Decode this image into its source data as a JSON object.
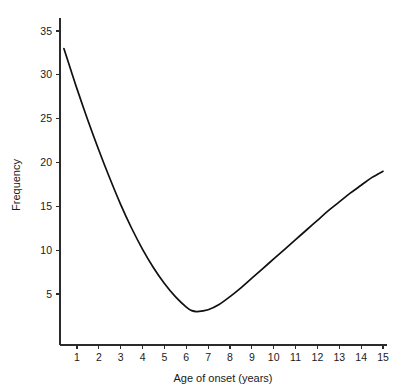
{
  "chart_data": {
    "type": "line",
    "title": "",
    "subtitle": "",
    "xlabel": "Age of onset (years)",
    "ylabel": "Frequency",
    "xlim": [
      0,
      15.6
    ],
    "ylim": [
      0,
      36.5
    ],
    "xticks": [
      1,
      2,
      3,
      4,
      5,
      6,
      7,
      8,
      9,
      10,
      11,
      12,
      13,
      14,
      15
    ],
    "xtick_labels": [
      "1",
      "2",
      "3",
      "4",
      "5",
      "6",
      "7",
      "8",
      "9",
      "10",
      "11",
      "12",
      "13",
      "14",
      "15"
    ],
    "yticks": [
      5,
      10,
      15,
      20,
      25,
      30,
      35
    ],
    "ytick_labels": [
      "5",
      "10",
      "15",
      "20",
      "25",
      "30",
      "35"
    ],
    "grid": false,
    "legend": null,
    "annotations": [],
    "line_color": "#101010",
    "background_color": "#ffffff",
    "series": [
      {
        "name": "Frequency of onset",
        "x": [
          0.4,
          0.75,
          1,
          1.5,
          2,
          2.5,
          3,
          3.5,
          4,
          4.5,
          5,
          5.5,
          6,
          6.25,
          6.5,
          7,
          7.5,
          8,
          8.5,
          9,
          9.5,
          10,
          10.5,
          11,
          11.5,
          12,
          12.5,
          13,
          13.5,
          14,
          14.5,
          15
        ],
        "y": [
          33.0,
          30.3,
          28.4,
          24.8,
          21.4,
          18.2,
          15.2,
          12.5,
          10.1,
          8.0,
          6.2,
          4.7,
          3.5,
          3.1,
          3.0,
          3.2,
          3.8,
          4.7,
          5.7,
          6.8,
          7.9,
          9.0,
          10.1,
          11.2,
          12.3,
          13.4,
          14.5,
          15.5,
          16.5,
          17.4,
          18.3,
          19.0
        ]
      }
    ]
  },
  "axes": {
    "x_axis_name": "x-axis",
    "y_axis_name": "y-axis"
  }
}
